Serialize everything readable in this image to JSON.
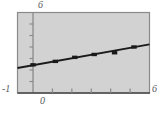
{
  "figure": {
    "name": "scatter-plot-with-regression-line",
    "background_color": "#ffffff",
    "plot_background_color": "#d2d2d2",
    "frame_color": "#8a8a8a",
    "line_color": "#1a1a1a",
    "point_color": "#1a1a1a",
    "axis_color": "#8a8a8a",
    "label_color": "#58595b"
  },
  "labels": {
    "y_max": "6",
    "y_min": "-1",
    "x_min": "0",
    "x_max": "6"
  },
  "chart_data": {
    "type": "scatter",
    "title": "",
    "xlabel": "",
    "ylabel": "",
    "xlim": [
      -0.8,
      6.0
    ],
    "ylim": [
      -1,
      6
    ],
    "grid": false,
    "legend": "none",
    "x_ticks": [
      0,
      1,
      2,
      3,
      4,
      5,
      6
    ],
    "y_ticks": [
      -1,
      0,
      1,
      2,
      3,
      4,
      5,
      6
    ],
    "x_tick_labels": [
      "0",
      "",
      "",
      "",
      "",
      "",
      "6"
    ],
    "y_tick_labels": [
      "-1",
      "",
      "",
      "",
      "",
      "",
      "",
      "6"
    ],
    "points": [
      {
        "x": 0.0,
        "y": 1.45
      },
      {
        "x": 1.15,
        "y": 1.75
      },
      {
        "x": 2.15,
        "y": 2.1
      },
      {
        "x": 3.15,
        "y": 2.35
      },
      {
        "x": 4.2,
        "y": 2.5
      },
      {
        "x": 5.2,
        "y": 3.0
      }
    ],
    "series": [
      {
        "name": "data points",
        "type": "scatter",
        "x": [
          0.0,
          1.15,
          2.15,
          3.15,
          4.2,
          5.2
        ],
        "values": [
          1.45,
          1.75,
          2.1,
          2.35,
          2.5,
          3.0
        ]
      },
      {
        "name": "regression line",
        "type": "line",
        "x": [
          -0.8,
          6.0
        ],
        "values": [
          1.17,
          3.23
        ],
        "slope": 0.3,
        "intercept": 1.43
      }
    ]
  }
}
